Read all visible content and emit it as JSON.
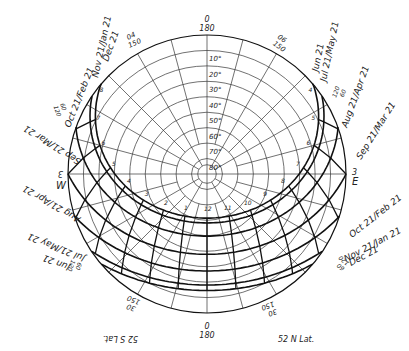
{
  "latitude_label": "52 N Lat.",
  "latitude_label_mirrored": "52 S Lat.",
  "center": {
    "x": 207,
    "y": 174
  },
  "radius": 139,
  "colors": {
    "line": "#222222",
    "bold": "#111111",
    "background": "#ffffff"
  },
  "north_label": {
    "top": "0",
    "bottom": "180"
  },
  "south_label": {
    "top": "0",
    "bottom": "180"
  },
  "altitude_labels": [
    "10°",
    "20°",
    "30°",
    "40°",
    "50°",
    "60°",
    "70°",
    "80°"
  ],
  "east_label": "E",
  "west_label": "W",
  "east_marker": "3",
  "west_marker": "3",
  "azimuth_labels": {
    "ne_upper": {
      "a": "06",
      "b": "150"
    },
    "nw_upper": {
      "a": "04",
      "b": "150"
    },
    "se_lower": {
      "a": "30",
      "b": "150"
    },
    "sw_lower": {
      "a": "30",
      "b": "150"
    },
    "ene": {
      "a": "120",
      "b": "60"
    },
    "ese": {
      "a": "60",
      "b": "120"
    },
    "wnw": {
      "a": "60",
      "b": "120"
    },
    "wsw": {
      "a": "60",
      "b": "120"
    }
  },
  "date_labels": {
    "right_1": "Jun 21",
    "right_2": "Jul 21/May 21",
    "right_3": "Aug 21/Apr 21",
    "right_4": "Sep 21/Mar 21",
    "right_5": "Oct 21/Feb 21",
    "right_6": "Nov 21/Jan 21",
    "right_7": "Dec 21",
    "left_1": "Nov 21/Jan 21",
    "left_2": "Dec 21",
    "left_3": "Oct 21/Feb 21",
    "left_4": "Sep 21/Mar 21",
    "left_5": "Aug 21/Apr 21",
    "left_6": "Jul 21/May 21",
    "left_7": "Jun 21"
  },
  "hour_labels": [
    "4",
    "5",
    "6",
    "7",
    "8",
    "9",
    "10",
    "11",
    "12",
    "1",
    "2",
    "3",
    "4",
    "5",
    "6",
    "7",
    "8"
  ],
  "hour_markers_visible": [
    "8",
    "9",
    "10",
    "11",
    "12",
    "1",
    "2",
    "3",
    "4",
    "5"
  ]
}
